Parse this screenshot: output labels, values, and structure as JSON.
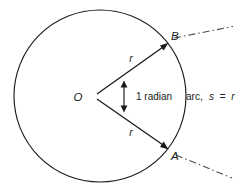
{
  "figure": {
    "type": "geometry-diagram",
    "canvas": {
      "width": 240,
      "height": 192,
      "background": "#ffffff"
    },
    "ink_color": "#1a1a1a",
    "guide_color": "#4a4a4a"
  },
  "circle": {
    "name": "main-circle",
    "center_x": 100,
    "center_y": 96,
    "radius": 86,
    "center_label": "O"
  },
  "points": {
    "center": {
      "label": "O",
      "x": 100,
      "y": 96
    },
    "b": {
      "label": "B",
      "x": 168,
      "y": 43,
      "label_x": 171,
      "label_y": 40
    },
    "a": {
      "label": "A",
      "x": 168,
      "y": 149,
      "label_x": 171,
      "label_y": 160
    }
  },
  "radii": [
    {
      "name": "radius-to-b",
      "label": "r",
      "label_x": 131,
      "label_y": 62
    },
    {
      "name": "radius-to-a",
      "label": "r",
      "label_x": 131,
      "label_y": 136
    }
  ],
  "angle": {
    "name": "central-angle",
    "label": "1 radian",
    "label_x": 136,
    "label_y": 100,
    "value": 1,
    "unit": "radian"
  },
  "arc": {
    "name": "arc-ab",
    "label_prefix": "arc,",
    "label_variable_s": "s",
    "label_equals": "=",
    "label_variable_r": "r",
    "label_full": "arc, s = r",
    "label_x": 186,
    "label_y": 100
  },
  "guides": [
    {
      "name": "extension-line-b",
      "from": "B",
      "direction": "up-right"
    },
    {
      "name": "extension-line-a",
      "from": "A",
      "direction": "down-right"
    }
  ],
  "relation": {
    "statement": "s = r",
    "meaning": "arc length equals radius when the central angle is 1 radian"
  }
}
